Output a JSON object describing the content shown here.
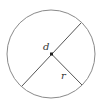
{
  "diagram": {
    "type": "circle-diameter-radius",
    "circle": {
      "cx": 51,
      "cy": 54,
      "r": 44,
      "stroke": "#8a8a8a"
    },
    "center_dot": {
      "cx": 51.5,
      "cy": 54,
      "size": 3,
      "fill": "#222222"
    },
    "diameter": {
      "x1": 81,
      "y1": 23,
      "x2": 22,
      "y2": 86,
      "stroke": "#555555"
    },
    "radius": {
      "x1": 51.5,
      "y1": 54,
      "x2": 82,
      "y2": 85,
      "stroke": "#555555"
    },
    "labels": {
      "diameter_label": {
        "text": "d",
        "x": 43,
        "y": 50
      },
      "radius_label": {
        "text": "r",
        "x": 61,
        "y": 79
      }
    }
  }
}
